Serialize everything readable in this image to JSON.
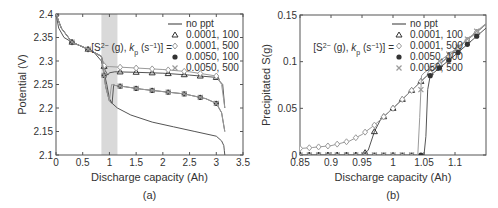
{
  "chart_data": [
    {
      "type": "line",
      "panel": "(a)",
      "xlabel": "Discharge capacity (Ah)",
      "ylabel": "Potential (V)",
      "xlim": [
        0,
        3.5
      ],
      "ylim": [
        2.1,
        2.4
      ],
      "xticks": [
        0,
        0.5,
        1,
        1.5,
        2,
        2.5,
        3,
        3.5
      ],
      "yticks": [
        2.1,
        2.15,
        2.2,
        2.25,
        2.3,
        2.35,
        2.4
      ],
      "shaded_region": [
        0.85,
        1.15
      ],
      "legend_title": "[S2−(g), kp (s−1)] =",
      "legend": [
        "no ppt",
        "0.0001, 100",
        "0.0001, 500",
        "0.0050, 100",
        "0.0050, 500"
      ],
      "series": [
        {
          "name": "no ppt",
          "marker": "none",
          "x": [
            0,
            0.05,
            0.15,
            0.3,
            0.5,
            0.7,
            0.85,
            0.95,
            1.0,
            1.05,
            1.15,
            1.4,
            1.8,
            2.2,
            2.6,
            3.0,
            3.1,
            3.14,
            3.15,
            3.16
          ],
          "y": [
            2.4,
            2.37,
            2.35,
            2.34,
            2.33,
            2.32,
            2.3,
            2.25,
            2.22,
            2.21,
            2.2,
            2.185,
            2.17,
            2.16,
            2.15,
            2.14,
            2.13,
            2.12,
            2.11,
            2.1
          ]
        },
        {
          "name": "0.0001, 100",
          "marker": "triangle",
          "x": [
            0,
            0.1,
            0.3,
            0.6,
            0.85,
            0.92,
            0.97,
            1.0,
            1.1,
            1.5,
            2.0,
            2.5,
            3.0,
            3.12,
            3.16
          ],
          "y": [
            2.4,
            2.37,
            2.34,
            2.325,
            2.31,
            2.28,
            2.27,
            2.275,
            2.277,
            2.276,
            2.274,
            2.27,
            2.265,
            2.25,
            2.2
          ]
        },
        {
          "name": "0.0001, 500",
          "marker": "diamond",
          "x": [
            0,
            0.1,
            0.3,
            0.6,
            0.85,
            0.9,
            0.95,
            1.0,
            1.5,
            2.0,
            2.5,
            3.0,
            3.1,
            3.16
          ],
          "y": [
            2.4,
            2.37,
            2.34,
            2.325,
            2.31,
            2.29,
            2.288,
            2.288,
            2.285,
            2.282,
            2.277,
            2.268,
            2.25,
            2.2
          ]
        },
        {
          "name": "0.0050, 100",
          "marker": "circle",
          "x": [
            0,
            0.1,
            0.3,
            0.6,
            0.85,
            0.93,
            1.0,
            1.05,
            1.08,
            1.1,
            1.3,
            1.6,
            2.0,
            2.4,
            2.8,
            3.0,
            3.1,
            3.16
          ],
          "y": [
            2.4,
            2.37,
            2.34,
            2.325,
            2.31,
            2.245,
            2.215,
            2.21,
            2.25,
            2.248,
            2.245,
            2.24,
            2.235,
            2.23,
            2.22,
            2.21,
            2.19,
            2.15
          ]
        },
        {
          "name": "0.0050, 500",
          "marker": "cross",
          "x": [
            0,
            0.1,
            0.3,
            0.6,
            0.85,
            0.93,
            1.0,
            1.04,
            1.1,
            1.3,
            1.6,
            2.0,
            2.4,
            2.8,
            3.0,
            3.1,
            3.16
          ],
          "y": [
            2.4,
            2.37,
            2.34,
            2.325,
            2.31,
            2.245,
            2.215,
            2.25,
            2.248,
            2.245,
            2.24,
            2.235,
            2.23,
            2.22,
            2.21,
            2.19,
            2.15
          ]
        }
      ]
    },
    {
      "type": "line",
      "panel": "(b)",
      "xlabel": "Discharge capacity (Ah)",
      "ylabel": "Precipitated S(g)",
      "xlim": [
        0.85,
        1.15
      ],
      "ylim": [
        0,
        0.15
      ],
      "xticks": [
        0.85,
        0.9,
        0.95,
        1,
        1.05,
        1.1
      ],
      "yticks": [
        0,
        0.05,
        0.1,
        0.15
      ],
      "legend_title": "[S2−(g), kp (s−1)] =",
      "legend": [
        "no ppt",
        "0.0001, 100",
        "0.0001, 500",
        "0.0050, 100",
        "0.0050, 500"
      ],
      "series": [
        {
          "name": "no ppt",
          "marker": "none",
          "x": [
            0.85,
            0.9,
            0.95,
            0.96
          ],
          "y": [
            0,
            0,
            0,
            0
          ]
        },
        {
          "name": "0.0001, 100",
          "marker": "triangle",
          "x": [
            0.85,
            0.9,
            0.95,
            0.96,
            0.97,
            0.98,
            1.0,
            1.05,
            1.1,
            1.15
          ],
          "y": [
            0,
            0,
            0,
            0.005,
            0.025,
            0.038,
            0.05,
            0.082,
            0.112,
            0.14
          ]
        },
        {
          "name": "0.0001, 500",
          "marker": "diamond",
          "x": [
            0.85,
            0.87,
            0.9,
            0.93,
            0.95,
            0.97,
            0.98,
            1.0,
            1.05,
            1.1,
            1.15
          ],
          "y": [
            0.007,
            0.008,
            0.01,
            0.015,
            0.022,
            0.032,
            0.038,
            0.05,
            0.082,
            0.112,
            0.14
          ]
        },
        {
          "name": "0.0050, 100",
          "marker": "circle",
          "x": [
            0.85,
            0.9,
            0.95,
            1.0,
            1.05,
            1.053,
            1.056,
            1.06,
            1.1,
            1.15
          ],
          "y": [
            0,
            0,
            0,
            0,
            0,
            0.02,
            0.07,
            0.085,
            0.107,
            0.136
          ]
        },
        {
          "name": "0.0050, 500",
          "marker": "cross",
          "x": [
            0.85,
            0.9,
            0.95,
            1.0,
            1.04,
            1.043,
            1.046,
            1.05,
            1.1,
            1.15
          ],
          "y": [
            0,
            0,
            0,
            0,
            0,
            0.04,
            0.085,
            0.088,
            0.113,
            0.141
          ]
        }
      ]
    }
  ],
  "colors": {
    "line": "#555555",
    "line_light": "#9a9a9a",
    "shade": "#d9d9d9",
    "axis": "#555555",
    "text": "#333333",
    "marker_dark": "#333333",
    "marker_light": "#9a9a9a"
  }
}
